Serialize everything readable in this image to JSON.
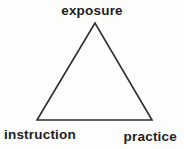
{
  "diagram": {
    "type": "triangle-concept-diagram",
    "background_color": "#fdfdfc",
    "line_color": "#2e2e2e",
    "text_color": "#1d1d1d",
    "triangle_points": "95,23 37,120 152,120",
    "labels": {
      "top": "exposure",
      "bottom_left": "instruction",
      "bottom_right": "practice"
    }
  }
}
